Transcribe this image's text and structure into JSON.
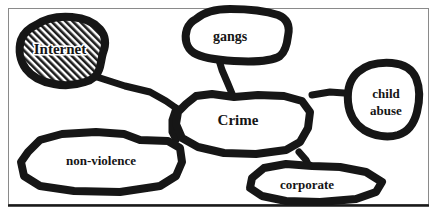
{
  "diagram": {
    "frame": {
      "border_color": "#8a8a8a",
      "bottom_rule_color": "#1a1a1a",
      "background": "#ffffff"
    },
    "style": {
      "stroke_color": "#161616",
      "label_color": "#151515",
      "hatch_color": "#1d1d1d",
      "halo_color": "#ffffff"
    },
    "nodes": [
      {
        "id": "internet",
        "label": "Internet",
        "fill": "hatched",
        "label_lines": [
          "Internet"
        ],
        "label_x": 60,
        "label_y": 51,
        "font_size": 15
      },
      {
        "id": "gangs",
        "label": "gangs",
        "fill": "white",
        "label_lines": [
          "gangs"
        ],
        "label_x": 230,
        "label_y": 38,
        "font_size": 14
      },
      {
        "id": "child-abuse",
        "label": "child abuse",
        "fill": "white",
        "label_lines": [
          "child",
          "abuse"
        ],
        "label_x": 385,
        "label_y": 102,
        "font_size": 13
      },
      {
        "id": "crime",
        "label": "Crime",
        "fill": "white",
        "label_lines": [
          "Crime"
        ],
        "label_x": 238,
        "label_y": 122,
        "font_size": 15
      },
      {
        "id": "non-violence",
        "label": "non-violence",
        "fill": "white",
        "label_lines": [
          "non-violence"
        ],
        "label_x": 100,
        "label_y": 161,
        "font_size": 13
      },
      {
        "id": "corporate",
        "label": "corporate",
        "fill": "white",
        "label_lines": [
          "corporate"
        ],
        "label_x": 306,
        "label_y": 186,
        "font_size": 13
      }
    ],
    "edges": [
      {
        "id": "internet-crime",
        "from": "internet",
        "to": "crime"
      },
      {
        "id": "gangs-crime",
        "from": "gangs",
        "to": "crime"
      },
      {
        "id": "crime-child-abuse",
        "from": "crime",
        "to": "child-abuse"
      },
      {
        "id": "crime-non-violence",
        "from": "crime",
        "to": "non-violence"
      },
      {
        "id": "crime-corporate",
        "from": "crime",
        "to": "corporate"
      }
    ]
  }
}
